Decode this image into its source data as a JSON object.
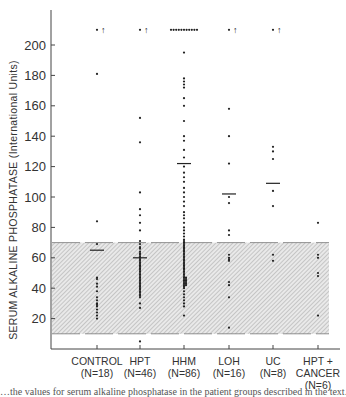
{
  "chart_data": {
    "type": "scatter",
    "subtype": "dot-strip-plot",
    "title": "",
    "xlabel": "",
    "ylabel": "SERUM ALKALINE PHOSPHATASE",
    "ylabel_units": "(International Units)",
    "ylim": [
      0,
      215
    ],
    "yticks": [
      20,
      40,
      60,
      80,
      100,
      120,
      140,
      160,
      180,
      200
    ],
    "grid": false,
    "legend": null,
    "normal_range": {
      "low": 10,
      "high": 70,
      "style": "diagonal-hatch"
    },
    "offscale_marker": {
      "value": 210,
      "symbol": "↑",
      "meaning": "value above 210 (off-scale)"
    },
    "categories": [
      {
        "label": "CONTROL",
        "n_label": "(N=18)",
        "median": 65,
        "values": [
          210,
          181,
          84,
          69,
          47,
          46,
          43,
          41,
          38,
          34,
          32,
          30,
          29,
          28,
          26,
          24,
          22,
          20
        ],
        "offscale": true
      },
      {
        "label": "HPT",
        "n_label": "(N=46)",
        "median": 60,
        "values": [
          210,
          152,
          136,
          103,
          92,
          88,
          83,
          78,
          71,
          69,
          67,
          66,
          64,
          63,
          62,
          61,
          60,
          59,
          58,
          57,
          56,
          55,
          54,
          53,
          52,
          51,
          50,
          49,
          48,
          47,
          46,
          45,
          44,
          43,
          42,
          41,
          40,
          39,
          38,
          37,
          36,
          35,
          34,
          30,
          27,
          5
        ],
        "offscale": true
      },
      {
        "label": "HHM",
        "n_label": "(N=86)",
        "median": 122,
        "values": [
          210,
          210,
          210,
          210,
          210,
          210,
          210,
          210,
          210,
          210,
          210,
          195,
          178,
          176,
          174,
          172,
          165,
          160,
          150,
          140,
          137,
          131,
          126,
          120,
          116,
          113,
          110,
          106,
          103,
          100,
          97,
          94,
          90,
          88,
          86,
          83,
          80,
          78,
          76,
          74,
          72,
          71,
          70,
          69,
          68,
          67,
          66,
          65,
          64,
          63,
          62,
          61,
          60,
          59,
          58,
          57,
          56,
          55,
          54,
          53,
          52,
          51,
          50,
          49,
          48,
          47,
          47,
          46,
          46,
          45,
          45,
          44,
          44,
          43,
          43,
          42,
          42,
          41,
          40,
          38,
          36,
          34,
          32,
          30,
          28,
          22
        ],
        "offscale": false
      },
      {
        "label": "LOH",
        "n_label": "(N=16)",
        "median": 102,
        "values": [
          210,
          158,
          140,
          122,
          100,
          96,
          78,
          75,
          62,
          60,
          59,
          58,
          44,
          42,
          34,
          14
        ],
        "offscale": true
      },
      {
        "label": "UC",
        "n_label": "(N=8)",
        "median": 109,
        "values": [
          210,
          133,
          130,
          125,
          104,
          94,
          62,
          58
        ],
        "offscale": true
      },
      {
        "label": "HPT + CANCER",
        "n_label": "(N=6)",
        "median": null,
        "values": [
          83,
          62,
          60,
          50,
          48,
          22
        ],
        "offscale": false
      }
    ]
  },
  "axis": {
    "ylabel_main": "SERUM ALKALINE PHOSPHATASE",
    "ylabel_units": "(International Units)"
  },
  "caption": {
    "text": "…the values for serum alkaline phosphatase in the patient groups described in the text…"
  }
}
